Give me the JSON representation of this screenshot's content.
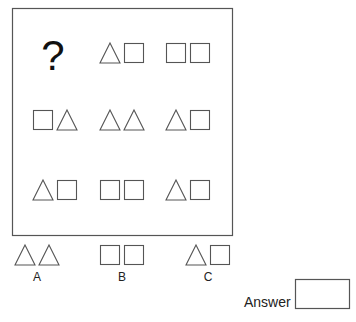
{
  "puzzle": {
    "grid": [
      [
        {
          "type": "question",
          "text": "?"
        },
        {
          "type": "pair",
          "shapes": [
            "triangle",
            "square"
          ]
        },
        {
          "type": "pair",
          "shapes": [
            "square",
            "square"
          ]
        }
      ],
      [
        {
          "type": "pair",
          "shapes": [
            "square",
            "triangle"
          ]
        },
        {
          "type": "pair",
          "shapes": [
            "triangle",
            "triangle"
          ]
        },
        {
          "type": "pair",
          "shapes": [
            "triangle",
            "square"
          ]
        }
      ],
      [
        {
          "type": "pair",
          "shapes": [
            "triangle",
            "square"
          ]
        },
        {
          "type": "pair",
          "shapes": [
            "square",
            "square"
          ]
        },
        {
          "type": "pair",
          "shapes": [
            "triangle",
            "square"
          ]
        }
      ]
    ],
    "options": [
      {
        "label": "A",
        "shapes": [
          "triangle",
          "triangle"
        ]
      },
      {
        "label": "B",
        "shapes": [
          "square",
          "square"
        ]
      },
      {
        "label": "C",
        "shapes": [
          "triangle",
          "square"
        ]
      }
    ],
    "answer_label": "Answer",
    "answer_value": ""
  },
  "colors": {
    "stroke": "#555555",
    "text": "#222222"
  }
}
